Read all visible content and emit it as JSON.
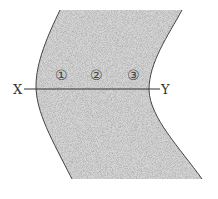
{
  "diagram": {
    "line_labels": {
      "start": "X",
      "end": "Y"
    },
    "points": [
      {
        "label": "①"
      },
      {
        "label": "②"
      },
      {
        "label": "③"
      }
    ],
    "colors": {
      "fill": "#d4d4d4",
      "stroke": "#444444",
      "background": "#ffffff"
    }
  }
}
